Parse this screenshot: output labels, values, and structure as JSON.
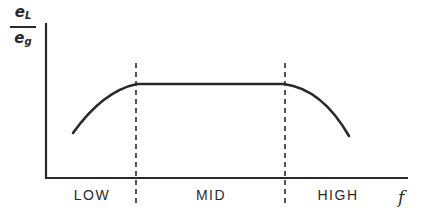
{
  "diagram": {
    "y_axis": {
      "label_numerator": "e",
      "label_numerator_sub": "L",
      "label_denominator": "e",
      "label_denominator_sub": "g"
    },
    "x_axis": {
      "label": "f"
    },
    "regions": [
      {
        "label": "LOW",
        "x_center": 92
      },
      {
        "label": "MID",
        "x_center": 210
      },
      {
        "label": "HIGH",
        "x_center": 338
      }
    ],
    "boundaries": [
      {
        "name": "low-mid-boundary",
        "x": 136
      },
      {
        "name": "mid-high-boundary",
        "x": 285
      }
    ],
    "curve": {
      "description": "Rises in LOW band, flat plateau in MID band, falls in HIGH band",
      "path": "M 73 133 Q 103 91 137 84 L 284 84 Q 322 89 349 136"
    },
    "colors": {
      "ink": "#2a2a2a",
      "background": "#ffffff"
    }
  }
}
